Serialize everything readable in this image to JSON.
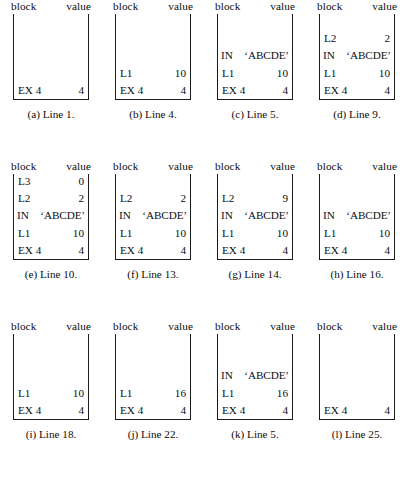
{
  "figure": {
    "columns": [
      "block",
      "value"
    ],
    "box_capacity": 5,
    "panels": [
      {
        "id": "a",
        "caption": "(a) Line 1.",
        "rows": [
          {
            "name": "EX 4",
            "value": "4",
            "wide": false
          }
        ]
      },
      {
        "id": "b",
        "caption": "(b) Line 4.",
        "rows": [
          {
            "name": "L1",
            "value": "10",
            "wide": false
          },
          {
            "name": "EX 4",
            "value": "4",
            "wide": false
          }
        ]
      },
      {
        "id": "c",
        "caption": "(c) Line 5.",
        "rows": [
          {
            "name": "IN",
            "value": "‘ABCDE’",
            "wide": true
          },
          {
            "name": "L1",
            "value": "10",
            "wide": false
          },
          {
            "name": "EX 4",
            "value": "4",
            "wide": false
          }
        ]
      },
      {
        "id": "d",
        "caption": "(d) Line 9.",
        "rows": [
          {
            "name": "L2",
            "value": "2",
            "wide": false
          },
          {
            "name": "IN",
            "value": "‘ABCDE’",
            "wide": true
          },
          {
            "name": "L1",
            "value": "10",
            "wide": false
          },
          {
            "name": "EX 4",
            "value": "4",
            "wide": false
          }
        ]
      },
      {
        "id": "e",
        "caption": "(e) Line 10.",
        "rows": [
          {
            "name": "L3",
            "value": "0",
            "wide": false
          },
          {
            "name": "L2",
            "value": "2",
            "wide": false
          },
          {
            "name": "IN",
            "value": "‘ABCDE’",
            "wide": true
          },
          {
            "name": "L1",
            "value": "10",
            "wide": false
          },
          {
            "name": "EX 4",
            "value": "4",
            "wide": false
          }
        ]
      },
      {
        "id": "f",
        "caption": "(f) Line 13.",
        "rows": [
          {
            "name": "L2",
            "value": "2",
            "wide": false
          },
          {
            "name": "IN",
            "value": "‘ABCDE’",
            "wide": true
          },
          {
            "name": "L1",
            "value": "10",
            "wide": false
          },
          {
            "name": "EX 4",
            "value": "4",
            "wide": false
          }
        ]
      },
      {
        "id": "g",
        "caption": "(g) Line 14.",
        "rows": [
          {
            "name": "L2",
            "value": "9",
            "wide": false
          },
          {
            "name": "IN",
            "value": "‘ABCDE’",
            "wide": true
          },
          {
            "name": "L1",
            "value": "10",
            "wide": false
          },
          {
            "name": "EX 4",
            "value": "4",
            "wide": false
          }
        ]
      },
      {
        "id": "h",
        "caption": "(h) Line 16.",
        "rows": [
          {
            "name": "IN",
            "value": "‘ABCDE’",
            "wide": true
          },
          {
            "name": "L1",
            "value": "10",
            "wide": false
          },
          {
            "name": "EX 4",
            "value": "4",
            "wide": false
          }
        ]
      },
      {
        "id": "i",
        "caption": "(i) Line 18.",
        "rows": [
          {
            "name": "L1",
            "value": "10",
            "wide": false
          },
          {
            "name": "EX 4",
            "value": "4",
            "wide": false
          }
        ]
      },
      {
        "id": "j",
        "caption": "(j) Line 22.",
        "rows": [
          {
            "name": "L1",
            "value": "16",
            "wide": false
          },
          {
            "name": "EX 4",
            "value": "4",
            "wide": false
          }
        ]
      },
      {
        "id": "k",
        "caption": "(k) Line 5.",
        "rows": [
          {
            "name": "IN",
            "value": "‘ABCDE’",
            "wide": true
          },
          {
            "name": "L1",
            "value": "16",
            "wide": false
          },
          {
            "name": "EX 4",
            "value": "4",
            "wide": false
          }
        ]
      },
      {
        "id": "l",
        "caption": "(l) Line 25.",
        "rows": [
          {
            "name": "EX 4",
            "value": "4",
            "wide": false
          }
        ]
      }
    ]
  }
}
